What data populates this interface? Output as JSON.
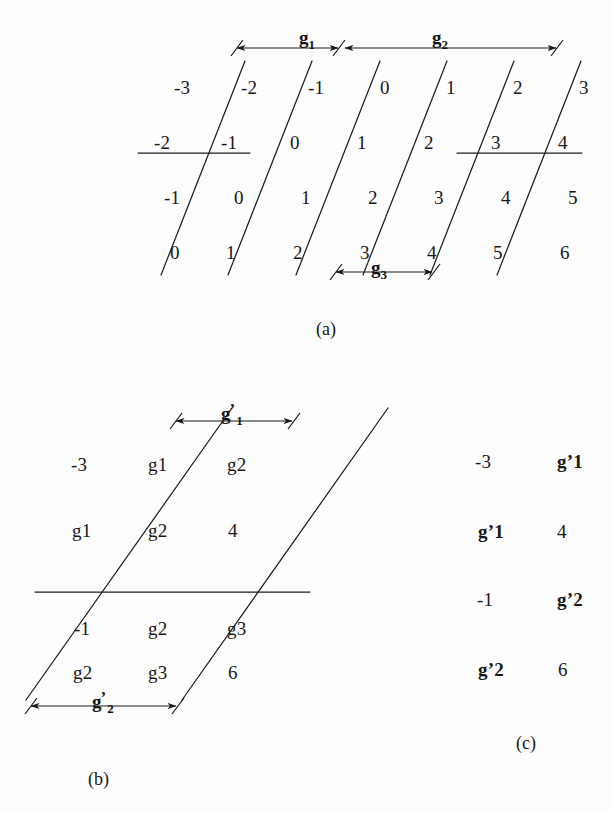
{
  "figure": {
    "background": "#fdfdfd",
    "ink": "#171717"
  },
  "panel_a": {
    "caption": "(a)",
    "grid": [
      [
        "-3",
        "-2",
        "-1",
        "0",
        "1",
        "2",
        "3"
      ],
      [
        "-2",
        "-1",
        "0",
        "1",
        "2",
        "3",
        "4"
      ],
      [
        "-1",
        "0",
        "1",
        "2",
        "3",
        "4",
        "5"
      ],
      [
        "0",
        "1",
        "2",
        "3",
        "4",
        "5",
        "6"
      ]
    ],
    "dimensions": [
      {
        "name": "g1",
        "base": "g",
        "sub": "1",
        "prime": ""
      },
      {
        "name": "g2",
        "base": "g",
        "sub": "2",
        "prime": ""
      },
      {
        "name": "g3",
        "base": "g",
        "sub": "3",
        "prime": ""
      }
    ]
  },
  "panel_b": {
    "caption": "(b)",
    "grid": [
      [
        {
          "base": "-3",
          "sub": "",
          "prime": ""
        },
        {
          "base": "g",
          "sub": "1",
          "prime": ""
        },
        {
          "base": "g",
          "sub": "2",
          "prime": ""
        }
      ],
      [
        {
          "base": "g",
          "sub": "1",
          "prime": ""
        },
        {
          "base": "g",
          "sub": "2",
          "prime": ""
        },
        {
          "base": "4",
          "sub": "",
          "prime": ""
        }
      ],
      [
        {
          "base": "-1",
          "sub": "",
          "prime": ""
        },
        {
          "base": "g",
          "sub": "2",
          "prime": ""
        },
        {
          "base": "g",
          "sub": "3",
          "prime": ""
        }
      ],
      [
        {
          "base": "g",
          "sub": "2",
          "prime": ""
        },
        {
          "base": "g",
          "sub": "3",
          "prime": ""
        },
        {
          "base": "6",
          "sub": "",
          "prime": ""
        }
      ]
    ],
    "dimensions": [
      {
        "name": "g1-prime",
        "base": "g",
        "sub": "1",
        "prime": "’"
      },
      {
        "name": "g2-prime",
        "base": "g",
        "sub": "2",
        "prime": "’"
      }
    ]
  },
  "panel_c": {
    "caption": "(c)",
    "grid": [
      [
        {
          "base": "-3",
          "sub": "",
          "prime": ""
        },
        {
          "base": "g",
          "sub": "1",
          "prime": "’"
        }
      ],
      [
        {
          "base": "g",
          "sub": "1",
          "prime": "’"
        },
        {
          "base": "4",
          "sub": "",
          "prime": ""
        }
      ],
      [
        {
          "base": "-1",
          "sub": "",
          "prime": ""
        },
        {
          "base": "g",
          "sub": "2",
          "prime": "’"
        }
      ],
      [
        {
          "base": "g",
          "sub": "2",
          "prime": "’"
        },
        {
          "base": "6",
          "sub": "",
          "prime": ""
        }
      ]
    ]
  }
}
